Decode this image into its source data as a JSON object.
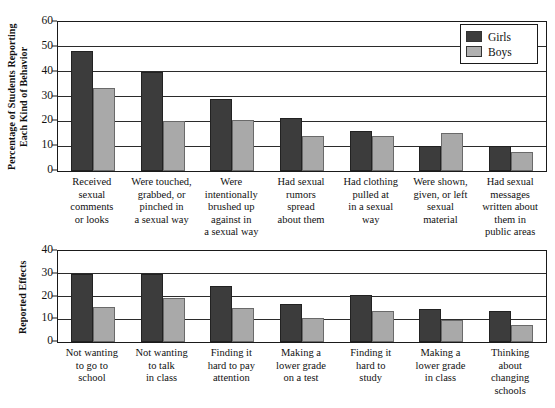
{
  "legend": {
    "entries": [
      {
        "label": "Girls",
        "color": "#3c3c3c"
      },
      {
        "label": "Boys",
        "color": "#a9a9a9"
      }
    ]
  },
  "colors": {
    "girls": "#3c3c3c",
    "boys": "#a9a9a9",
    "axis": "#1a1a1a",
    "background": "#ffffff"
  },
  "chart_data": [
    {
      "type": "bar",
      "title": "",
      "xlabel": "",
      "ylabel": "Percentage of Students Reporting\nEach Kind of Behavior",
      "ylim": [
        0,
        60
      ],
      "yticks": [
        0,
        10,
        20,
        30,
        40,
        50,
        60
      ],
      "grid": true,
      "legend_position": "top-right",
      "categories": [
        "Received\nsexual\ncomments\nor looks",
        "Were touched,\ngrabbed, or\npinched in\na sexual way",
        "Were\nintentionally\nbrushed up\nagainst in\na sexual way",
        "Had sexual\nrumors\nspread\nabout them",
        "Had clothing\npulled at\nin a sexual\nway",
        "Were shown,\ngiven, or left\nsexual\nmaterial",
        "Had sexual\nmessages\nwritten about\nthem in\npublic areas"
      ],
      "series": [
        {
          "name": "Girls",
          "values": [
            48.5,
            40,
            29,
            21.5,
            16,
            10,
            10
          ]
        },
        {
          "name": "Boys",
          "values": [
            33.5,
            20,
            20.5,
            14,
            14,
            15.5,
            7.5
          ]
        }
      ]
    },
    {
      "type": "bar",
      "title": "",
      "xlabel": "",
      "ylabel": "Reported Effects",
      "ylim": [
        0,
        40
      ],
      "yticks": [
        0,
        10,
        20,
        30,
        40
      ],
      "grid": true,
      "legend_position": "none",
      "categories": [
        "Not wanting\nto go to\nschool",
        "Not wanting\nto talk\nin class",
        "Finding it\nhard to pay\nattention",
        "Making a\nlower grade\non a test",
        "Finding it\nhard to\nstudy",
        "Making a\nlower grade\nin class",
        "Thinking\nabout\nchanging\nschools"
      ],
      "series": [
        {
          "name": "Girls",
          "values": [
            30,
            30,
            24.5,
            16.5,
            20.5,
            14.5,
            13.5
          ]
        },
        {
          "name": "Boys",
          "values": [
            15.5,
            19.5,
            15,
            10.5,
            13.5,
            9.5,
            7.5
          ]
        }
      ]
    }
  ]
}
